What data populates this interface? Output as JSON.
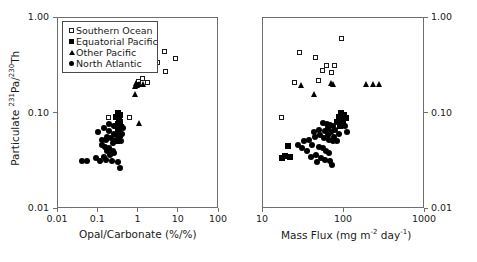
{
  "figure": {
    "background_color": "#ffffff",
    "marker_color": "#000000",
    "frame_color": "#6e6e6e"
  },
  "legend": {
    "items": [
      {
        "label": "Southern Ocean",
        "marker": "open-square"
      },
      {
        "label": "Equatorial Pacific",
        "marker": "filled-square"
      },
      {
        "label": "Other Pacific",
        "marker": "triangle"
      },
      {
        "label": "North Atlantic",
        "marker": "circle"
      }
    ]
  },
  "shared": {
    "ylabel_text": "Particulate ",
    "ylabel_sup1": "231",
    "ylabel_mid": "Pa/",
    "ylabel_sup2": "230",
    "ylabel_end": "Th",
    "y_ticks": [
      "1.00",
      "0.10",
      "0.01"
    ],
    "y_values": [
      1.0,
      0.1,
      0.01
    ],
    "ylim": [
      0.01,
      1.0
    ]
  },
  "chart_data": [
    {
      "type": "scatter",
      "panel": "left",
      "title": "",
      "xlabel": "Opal/Carbonate (%/%)",
      "ylabel": "Particulate 231Pa/230Th",
      "xscale": "log",
      "yscale": "log",
      "xlim": [
        0.01,
        100
      ],
      "ylim": [
        0.01,
        1.0
      ],
      "xticks": [
        "0.01",
        "0.1",
        "1",
        "10",
        "100"
      ],
      "xtick_values": [
        0.01,
        0.1,
        1,
        10,
        100
      ],
      "yticks": [
        "1.00",
        "0.10",
        "0.01"
      ],
      "ytick_values": [
        1.0,
        0.1,
        0.01
      ],
      "grid": false,
      "legend_position": "top-left",
      "series": [
        {
          "name": "Southern Ocean",
          "marker": "open-square",
          "points": [
            [
              2.0,
              0.6
            ],
            [
              4.6,
              0.44
            ],
            [
              9.0,
              0.37
            ],
            [
              3.1,
              0.33
            ],
            [
              1.55,
              0.3
            ],
            [
              2.3,
              0.275
            ],
            [
              5.0,
              0.27
            ],
            [
              1.3,
              0.225
            ],
            [
              1.05,
              0.21
            ],
            [
              1.75,
              0.205
            ],
            [
              0.98,
              0.195
            ],
            [
              0.19,
              0.088
            ],
            [
              0.62,
              0.088
            ]
          ]
        },
        {
          "name": "Equatorial Pacific",
          "marker": "filled-square",
          "points": [
            [
              0.33,
              0.098
            ],
            [
              0.37,
              0.094
            ],
            [
              0.3,
              0.09
            ],
            [
              0.34,
              0.086
            ],
            [
              0.36,
              0.08
            ],
            [
              0.33,
              0.076
            ],
            [
              0.3,
              0.072
            ],
            [
              0.38,
              0.07
            ],
            [
              0.35,
              0.066
            ],
            [
              0.32,
              0.062
            ],
            [
              0.36,
              0.058
            ],
            [
              0.34,
              0.054
            ],
            [
              0.31,
              0.05
            ]
          ]
        },
        {
          "name": "Other Pacific",
          "marker": "triangle",
          "points": [
            [
              0.95,
              0.205
            ],
            [
              1.15,
              0.2
            ],
            [
              1.45,
              0.2
            ],
            [
              1.02,
              0.195
            ],
            [
              0.88,
              0.19
            ],
            [
              0.9,
              0.155
            ],
            [
              1.12,
              0.077
            ]
          ]
        },
        {
          "name": "North Atlantic",
          "marker": "circle",
          "points": [
            [
              0.105,
              0.062
            ],
            [
              0.145,
              0.068
            ],
            [
              0.2,
              0.064
            ],
            [
              0.26,
              0.06
            ],
            [
              0.17,
              0.056
            ],
            [
              0.22,
              0.054
            ],
            [
              0.3,
              0.058
            ],
            [
              0.28,
              0.05
            ],
            [
              0.13,
              0.046
            ],
            [
              0.155,
              0.044
            ],
            [
              0.195,
              0.042
            ],
            [
              0.24,
              0.048
            ],
            [
              0.175,
              0.04
            ],
            [
              0.21,
              0.036
            ],
            [
              0.265,
              0.038
            ],
            [
              0.145,
              0.034
            ],
            [
              0.165,
              0.032
            ],
            [
              0.115,
              0.031
            ],
            [
              0.095,
              0.033
            ],
            [
              0.055,
              0.031
            ],
            [
              0.043,
              0.031
            ],
            [
              0.235,
              0.031
            ],
            [
              0.325,
              0.03
            ],
            [
              0.37,
              0.026
            ],
            [
              0.4,
              0.05
            ],
            [
              0.42,
              0.06
            ],
            [
              0.44,
              0.068
            ],
            [
              0.26,
              0.072
            ],
            [
              0.2,
              0.076
            ],
            [
              0.165,
              0.052
            ],
            [
              0.24,
              0.04
            ],
            [
              0.135,
              0.052
            ]
          ]
        }
      ]
    },
    {
      "type": "scatter",
      "panel": "right",
      "title": "",
      "xlabel": "Mass Flux (mg m-2 day-1)",
      "ylabel": "Particulate 231Pa/230Th",
      "xscale": "log",
      "yscale": "log",
      "xlim": [
        10,
        1000
      ],
      "ylim": [
        0.01,
        1.0
      ],
      "xticks": [
        "10",
        "100",
        "1000"
      ],
      "xtick_values": [
        10,
        100,
        1000
      ],
      "yticks": [
        "1.00",
        "0.10",
        "0.01"
      ],
      "ytick_values": [
        1.0,
        0.1,
        0.01
      ],
      "grid": false,
      "legend_position": "none",
      "series": [
        {
          "name": "Southern Ocean",
          "marker": "open-square",
          "points": [
            [
              97.0,
              0.6
            ],
            [
              29.0,
              0.42
            ],
            [
              46.0,
              0.38
            ],
            [
              62.0,
              0.31
            ],
            [
              78.0,
              0.31
            ],
            [
              56.0,
              0.275
            ],
            [
              72.0,
              0.265
            ],
            [
              50.0,
              0.215
            ],
            [
              25.0,
              0.205
            ],
            [
              17.5,
              0.088
            ]
          ]
        },
        {
          "name": "Equatorial Pacific",
          "marker": "filled-square",
          "points": [
            [
              95.0,
              0.098
            ],
            [
              103.0,
              0.094
            ],
            [
              88.0,
              0.09
            ],
            [
              97.0,
              0.085
            ],
            [
              84.0,
              0.08
            ],
            [
              100.0,
              0.076
            ],
            [
              21.0,
              0.045
            ],
            [
              19.0,
              0.035
            ],
            [
              17.5,
              0.033
            ],
            [
              22.0,
              0.034
            ],
            [
              110.0,
              0.088
            ],
            [
              92.0,
              0.072
            ]
          ]
        },
        {
          "name": "Other Pacific",
          "marker": "triangle",
          "points": [
            [
              72.0,
              0.205
            ],
            [
              77.0,
              0.2
            ],
            [
              195.0,
              0.2
            ],
            [
              240.0,
              0.2
            ],
            [
              280.0,
              0.2
            ],
            [
              31.0,
              0.195
            ],
            [
              44.0,
              0.155
            ]
          ]
        },
        {
          "name": "North Atlantic",
          "marker": "circle",
          "points": [
            [
              57.0,
              0.078
            ],
            [
              63.0,
              0.076
            ],
            [
              70.0,
              0.074
            ],
            [
              76.0,
              0.072
            ],
            [
              66.0,
              0.068
            ],
            [
              60.0,
              0.064
            ],
            [
              72.0,
              0.062
            ],
            [
              80.0,
              0.066
            ],
            [
              88.0,
              0.06
            ],
            [
              105.0,
              0.072
            ],
            [
              112.0,
              0.062
            ],
            [
              52.0,
              0.058
            ],
            [
              45.0,
              0.056
            ],
            [
              58.0,
              0.054
            ],
            [
              67.0,
              0.052
            ],
            [
              75.0,
              0.05
            ],
            [
              38.0,
              0.052
            ],
            [
              33.0,
              0.05
            ],
            [
              42.0,
              0.046
            ],
            [
              50.0,
              0.044
            ],
            [
              56.0,
              0.042
            ],
            [
              62.0,
              0.04
            ],
            [
              68.0,
              0.038
            ],
            [
              47.0,
              0.036
            ],
            [
              40.0,
              0.034
            ],
            [
              54.0,
              0.033
            ],
            [
              60.0,
              0.032
            ],
            [
              70.0,
              0.031
            ],
            [
              36.0,
              0.04
            ],
            [
              28.0,
              0.046
            ],
            [
              31.0,
              0.042
            ],
            [
              44.0,
              0.062
            ],
            [
              51.0,
              0.066
            ],
            [
              65.0,
              0.058
            ],
            [
              78.0,
              0.056
            ],
            [
              85.0,
              0.05
            ],
            [
              73.0,
              0.028
            ],
            [
              48.0,
              0.03
            ]
          ]
        }
      ]
    }
  ]
}
